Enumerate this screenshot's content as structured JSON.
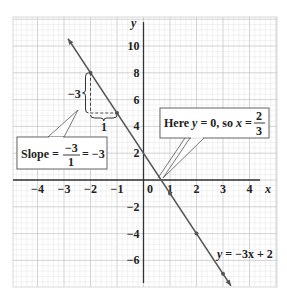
{
  "chart_data": {
    "type": "line",
    "title": "",
    "xlabel": "x",
    "ylabel": "y",
    "xlim": [
      -5,
      5
    ],
    "ylim": [
      -8,
      12
    ],
    "grid": true,
    "x_ticks": [
      "-4",
      "-3",
      "-2",
      "-1",
      "0",
      "1",
      "2",
      "3",
      "4"
    ],
    "y_ticks": [
      "10",
      "8",
      "6",
      "4",
      "2",
      "-2",
      "-4",
      "-6"
    ],
    "series": [
      {
        "name": "y = -3x + 2",
        "equation": "y = -3x + 2",
        "slope": -3,
        "intercept": 2,
        "points": [
          {
            "x": -2,
            "y": 8
          },
          {
            "x": -1,
            "y": 5
          },
          {
            "x": 1,
            "y": -1
          },
          {
            "x": 2,
            "y": -4
          },
          {
            "x": 3,
            "y": -7
          }
        ]
      }
    ],
    "annotations": [
      {
        "text": "Slope = -3/1 = -3",
        "numerator": "-3",
        "denominator": "1",
        "result": "-3"
      },
      {
        "text": "Here y = 0, so x = 2/3",
        "x_intercept_num": "2",
        "x_intercept_den": "3"
      },
      {
        "text": "-3",
        "role": "rise"
      },
      {
        "text": "1",
        "role": "run"
      }
    ]
  },
  "labels": {
    "x_axis": "x",
    "y_axis": "y",
    "origin": "0",
    "line_label_prefix": "y",
    "line_label_rest": " = −3x + 2",
    "rise": "−3",
    "run": "1",
    "slope_word": "Slope =",
    "slope_num": "−3",
    "slope_den": "1",
    "slope_result": "= −3",
    "here_pre": "Here ",
    "here_y": "y",
    "here_mid": " = 0, so ",
    "here_x": "x",
    "here_eq": " =",
    "here_num": "2",
    "here_den": "3"
  },
  "ticks": {
    "x": [
      {
        "v": -4,
        "t": "−4"
      },
      {
        "v": -3,
        "t": "−3"
      },
      {
        "v": -2,
        "t": "−2"
      },
      {
        "v": -1,
        "t": "−1"
      },
      {
        "v": 1,
        "t": "1"
      },
      {
        "v": 2,
        "t": "2"
      },
      {
        "v": 3,
        "t": "3"
      },
      {
        "v": 4,
        "t": "4"
      }
    ],
    "y": [
      {
        "v": 10,
        "t": "10"
      },
      {
        "v": 8,
        "t": "8"
      },
      {
        "v": 6,
        "t": "6"
      },
      {
        "v": 4,
        "t": "4"
      },
      {
        "v": 2,
        "t": "2"
      },
      {
        "v": -2,
        "t": "−2"
      },
      {
        "v": -4,
        "t": "−4"
      },
      {
        "v": -6,
        "t": "−6"
      }
    ]
  },
  "colors": {
    "grid_minor": "#e4e4e4",
    "grid_major": "#c8c8c8",
    "axis": "#333333",
    "line": "#555555",
    "box_border": "#555555"
  }
}
